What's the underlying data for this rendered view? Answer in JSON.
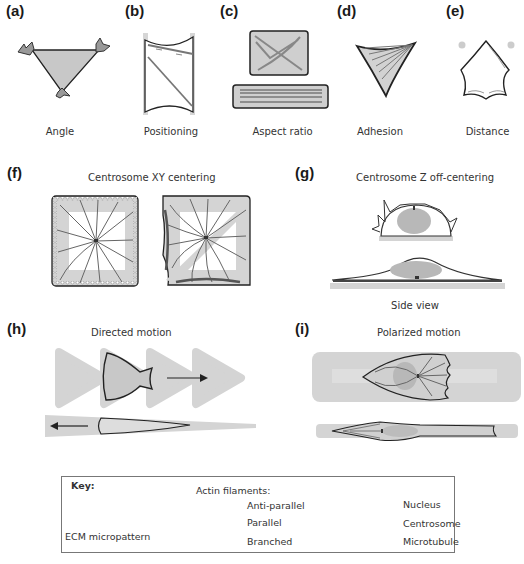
{
  "figure": {
    "panels": [
      {
        "id": "a",
        "letter": "(a)",
        "caption": "Angle"
      },
      {
        "id": "b",
        "letter": "(b)",
        "caption": "Positioning"
      },
      {
        "id": "c",
        "letter": "(c)",
        "caption": "Aspect ratio"
      },
      {
        "id": "d",
        "letter": "(d)",
        "caption": "Adhesion"
      },
      {
        "id": "e",
        "letter": "(e)",
        "caption": "Distance"
      },
      {
        "id": "f",
        "letter": "(f)",
        "title": "Centrosome XY centering"
      },
      {
        "id": "g",
        "letter": "(g)",
        "title": "Centrosome Z off-centering",
        "caption": "Side view"
      },
      {
        "id": "h",
        "letter": "(h)",
        "title": "Directed motion"
      },
      {
        "id": "i",
        "letter": "(i)",
        "title": "Polarized motion"
      }
    ],
    "key": {
      "heading": "Key:",
      "ecm_label": "ECM micropattern",
      "actin_heading": "Actin filaments:",
      "actin_items": [
        "Anti-parallel",
        "Parallel",
        "Branched"
      ],
      "other_items": [
        "Nucleus",
        "Centrosome",
        "Microtubule"
      ]
    },
    "colors": {
      "ecm": "#d4d4d4",
      "nucleus": "#b8b8b8",
      "outline": "#2a2a2a",
      "actin": "#777777",
      "microtubule": "#555555"
    }
  }
}
